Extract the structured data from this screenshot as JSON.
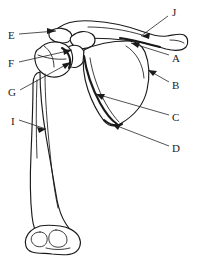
{
  "figure": {
    "background_color": "#ffffff",
    "line_color": "#1a1a1a",
    "width": 201,
    "height": 263
  },
  "labels": [
    {
      "id": "label-j",
      "text": "J",
      "x": 172,
      "y": 13,
      "anchor": "start"
    },
    {
      "id": "label-e",
      "text": "E",
      "x": 8,
      "y": 36,
      "anchor": "start"
    },
    {
      "id": "label-a",
      "text": "A",
      "x": 172,
      "y": 59,
      "anchor": "start"
    },
    {
      "id": "label-f",
      "text": "F",
      "x": 8,
      "y": 64,
      "anchor": "start"
    },
    {
      "id": "label-b",
      "text": "B",
      "x": 172,
      "y": 86,
      "anchor": "start"
    },
    {
      "id": "label-g",
      "text": "G",
      "x": 8,
      "y": 93,
      "anchor": "start"
    },
    {
      "id": "label-c",
      "text": "C",
      "x": 172,
      "y": 118,
      "anchor": "start"
    },
    {
      "id": "label-i",
      "text": "I",
      "x": 11,
      "y": 122,
      "anchor": "start"
    },
    {
      "id": "label-d",
      "text": "D",
      "x": 172,
      "y": 149,
      "anchor": "start"
    }
  ],
  "leaders": [
    {
      "id": "leader-j",
      "label": "J",
      "path": "M 168 16 L 141 36",
      "arrow_at": [
        141,
        36
      ],
      "arrow_angle": 143
    },
    {
      "id": "leader-e",
      "label": "E",
      "path": "M 19 34 L 56 31",
      "arrow_at": [
        56,
        31
      ],
      "arrow_angle": -5
    },
    {
      "id": "leader-a",
      "label": "A",
      "path": "M 169 55 L 131 43",
      "arrow_at": [
        131,
        43
      ],
      "arrow_angle": 198
    },
    {
      "id": "leader-f",
      "label": "F",
      "path": "M 19 62 L 72 50",
      "arrow_at": [
        72,
        50
      ],
      "arrow_angle": -13
    },
    {
      "id": "leader-b",
      "label": "B",
      "path": "M 169 82 L 148 70",
      "arrow_at": [
        148,
        70
      ],
      "arrow_angle": 210
    },
    {
      "id": "leader-g",
      "label": "G",
      "path": "M 20 90 L 71 62",
      "arrow_at": [
        71,
        62
      ],
      "arrow_angle": -29
    },
    {
      "id": "leader-c",
      "label": "C",
      "path": "M 169 115 L 96 94",
      "arrow_at": [
        96,
        94
      ],
      "arrow_angle": 196
    },
    {
      "id": "leader-i",
      "label": "I",
      "path": "M 19 120 L 46 129",
      "arrow_at": [
        46,
        129
      ],
      "arrow_angle": 18
    },
    {
      "id": "leader-d",
      "label": "D",
      "path": "M 169 146 L 112 124",
      "arrow_at": [
        112,
        124
      ],
      "arrow_angle": 201
    }
  ],
  "structures": [
    {
      "id": "clavicle",
      "name": "clavicle"
    },
    {
      "id": "scapula",
      "name": "scapula"
    },
    {
      "id": "humerus",
      "name": "humerus"
    },
    {
      "id": "acromion",
      "name": "acromion"
    },
    {
      "id": "coracoid",
      "name": "coracoid-process"
    },
    {
      "id": "humeral-head",
      "name": "humeral-head"
    },
    {
      "id": "greater-tubercle",
      "name": "greater-tubercle"
    },
    {
      "id": "lateral-border",
      "name": "scapula-lateral-border"
    },
    {
      "id": "inferior-angle",
      "name": "scapula-inferior-angle"
    },
    {
      "id": "distal-humerus",
      "name": "distal-humerus-condyles"
    }
  ]
}
